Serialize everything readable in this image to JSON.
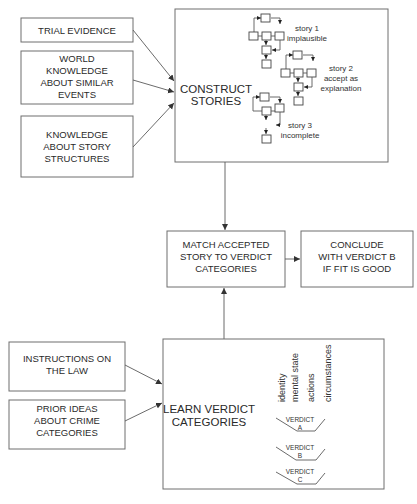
{
  "diagram": {
    "type": "flowchart",
    "colors": {
      "line": "#5a5a5a",
      "box_border": "#6e6e6e",
      "text": "#2a2a2a",
      "background": "#ffffff"
    },
    "inputs_top": [
      {
        "id": "trial-evidence",
        "lines": [
          "TRIAL EVIDENCE"
        ]
      },
      {
        "id": "world-knowledge",
        "lines": [
          "WORLD",
          "KNOWLEDGE",
          "ABOUT SIMILAR",
          "EVENTS"
        ]
      },
      {
        "id": "story-structures",
        "lines": [
          "KNOWLEDGE",
          "ABOUT STORY",
          "STRUCTURES"
        ]
      }
    ],
    "construct_stories": {
      "lines": [
        "CONSTRUCT",
        "STORIES"
      ],
      "stories": [
        {
          "lines": [
            "story 1",
            "implausible"
          ]
        },
        {
          "lines": [
            "story 2",
            "accept as",
            "explanation"
          ]
        },
        {
          "lines": [
            "story 3",
            "incomplete"
          ]
        }
      ]
    },
    "match": {
      "lines": [
        "MATCH ACCEPTED",
        "STORY TO VERDICT",
        "CATEGORIES"
      ]
    },
    "conclude": {
      "lines": [
        "CONCLUDE",
        "WITH VERDICT B",
        "IF FIT IS GOOD"
      ]
    },
    "inputs_bottom": [
      {
        "id": "instructions-law",
        "lines": [
          "INSTRUCTIONS ON",
          "THE LAW"
        ]
      },
      {
        "id": "prior-ideas",
        "lines": [
          "PRIOR IDEAS",
          "ABOUT CRIME",
          "CATEGORIES"
        ]
      }
    ],
    "learn_verdict": {
      "lines": [
        "LEARN VERDICT",
        "CATEGORIES"
      ],
      "attributes": [
        "identity",
        "mental state",
        "actions",
        "circumstances"
      ],
      "verdicts": [
        {
          "label": "VERDICT",
          "letter": "A"
        },
        {
          "label": "VERDICT",
          "letter": "B"
        },
        {
          "label": "VERDICT",
          "letter": "C"
        }
      ]
    }
  }
}
